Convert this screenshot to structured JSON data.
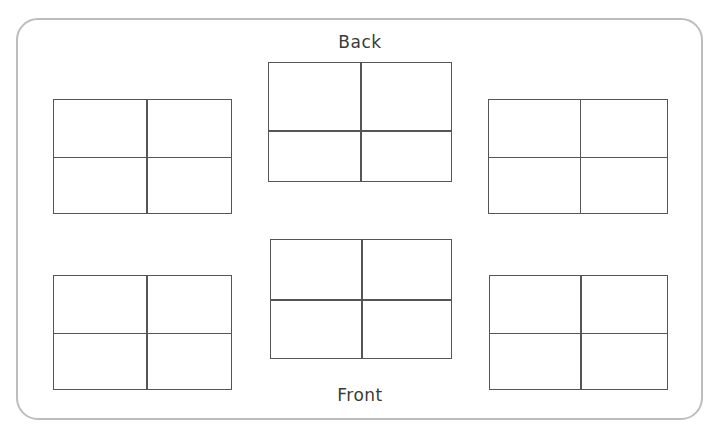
{
  "diagram": {
    "background_color": "#ffffff",
    "room": {
      "border_color": "#bdbdbd",
      "x": 16,
      "y": 18,
      "width": 687,
      "height": 402,
      "corner_radius": 22
    },
    "labels": {
      "back": "Back",
      "front": "Front"
    },
    "desk_style": {
      "stroke_color": "#555555",
      "fill_color": "#ffffff",
      "seats_per_group": 4,
      "columns": 2,
      "rows": 2
    },
    "desk_groups": [
      {
        "name": "back-left",
        "x": 53,
        "y": 99,
        "width": 179,
        "height": 115,
        "divider_x_pct": 52,
        "divider_y_pct": 50
      },
      {
        "name": "back-center",
        "x": 268,
        "y": 62,
        "width": 184,
        "height": 120,
        "divider_x_pct": 50,
        "divider_y_pct": 57
      },
      {
        "name": "back-right",
        "x": 488,
        "y": 99,
        "width": 180,
        "height": 115,
        "divider_x_pct": 51,
        "divider_y_pct": 50
      },
      {
        "name": "front-left",
        "x": 53,
        "y": 275,
        "width": 179,
        "height": 115,
        "divider_x_pct": 52,
        "divider_y_pct": 50
      },
      {
        "name": "front-center",
        "x": 270,
        "y": 239,
        "width": 182,
        "height": 120,
        "divider_x_pct": 50,
        "divider_y_pct": 50
      },
      {
        "name": "front-right",
        "x": 489,
        "y": 275,
        "width": 179,
        "height": 115,
        "divider_x_pct": 51,
        "divider_y_pct": 50
      }
    ]
  }
}
